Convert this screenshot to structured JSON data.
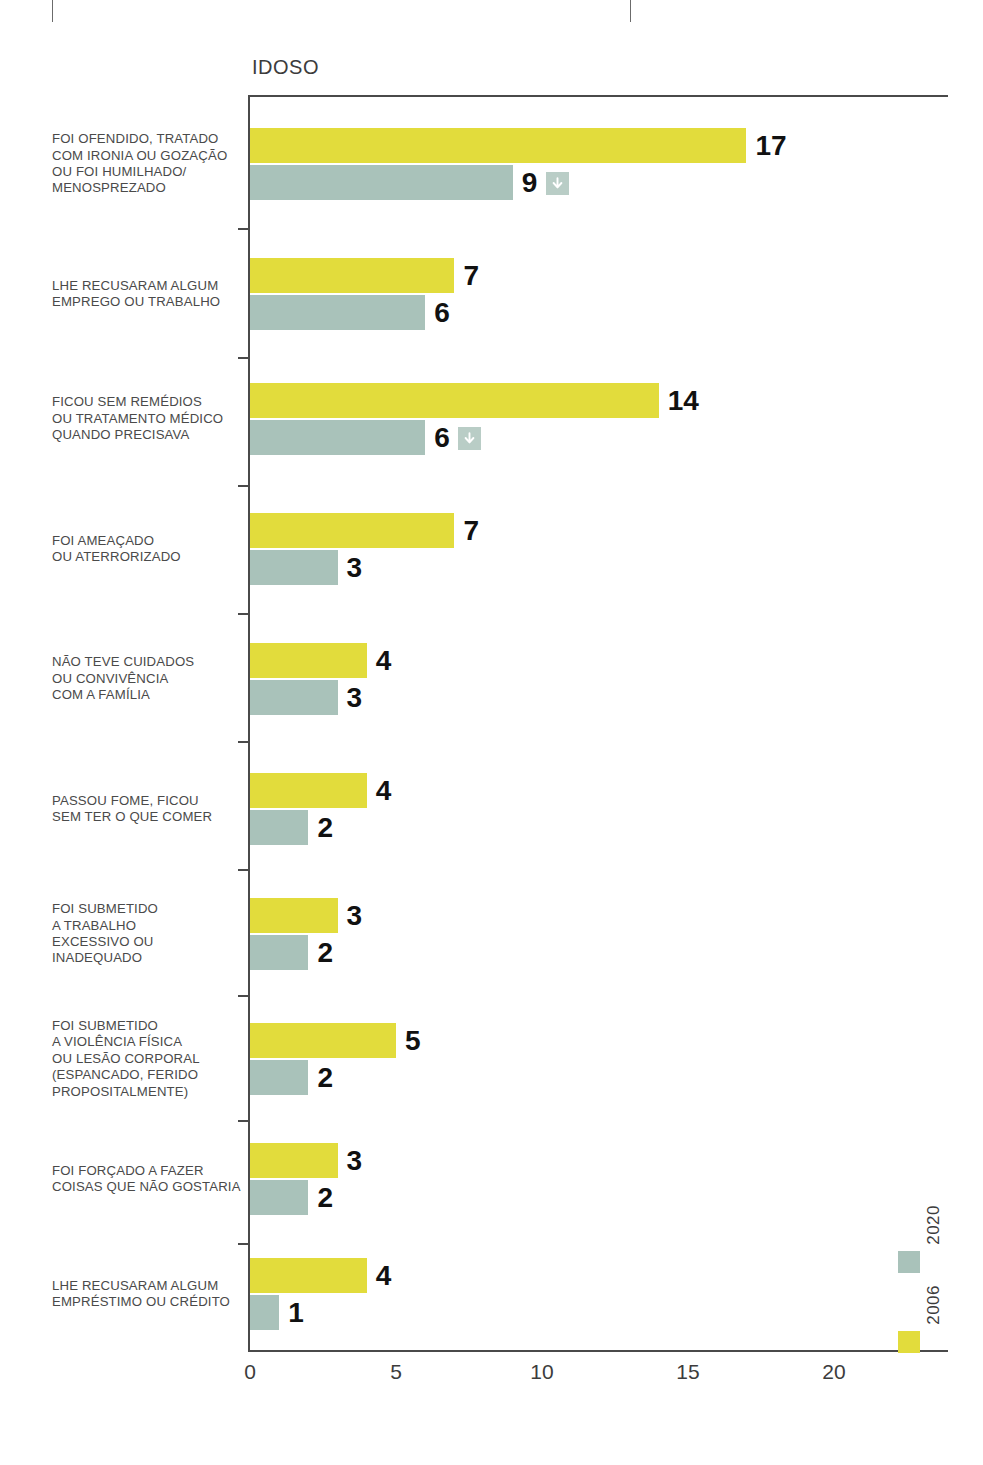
{
  "chart_data": {
    "type": "bar",
    "orientation": "horizontal",
    "title": "IDOSO",
    "xlabel": "",
    "ylabel": "",
    "xlim": [
      0,
      23.8
    ],
    "xticks": [
      0,
      5,
      10,
      15,
      20
    ],
    "xtick_labels": [
      "0",
      "5",
      "10",
      "15",
      "20"
    ],
    "grid": false,
    "legend_position": "bottom-right-vertical",
    "categories": [
      "FOI OFENDIDO, TRATADO COM IRONIA OU GOZAÇÃO OU FOI HUMILHADO/ MENOSPREZADO",
      "LHE RECUSARAM ALGUM EMPREGO OU TRABALHO",
      "FICOU SEM REMÉDIOS OU TRATAMENTO MÉDICO QUANDO PRECISAVA",
      "FOI AMEAÇADO OU ATERRORIZADO",
      "NÃO TEVE CUIDADOS OU CONVIVÊNCIA COM A FAMÍLIA",
      "PASSOU FOME, FICOU SEM TER O QUE COMER",
      "FOI SUBMETIDO A TRABALHO EXCESSIVO OU INADEQUADO",
      "FOI SUBMETIDO A VIOLÊNCIA FÍSICA OU LESÃO CORPORAL (ESPANCADO, FERIDO PROPOSITALMENTE)",
      "FOI FORÇADO A FAZER COISAS QUE NÃO GOSTARIA",
      "LHE RECUSARAM ALGUM EMPRÉSTIMO OU CRÉDITO"
    ],
    "category_lines": [
      [
        "FOI OFENDIDO, TRATADO",
        "COM IRONIA OU GOZAÇÃO",
        "OU FOI HUMILHADO/",
        "MENOSPREZADO"
      ],
      [
        "LHE RECUSARAM ALGUM",
        "EMPREGO OU TRABALHO"
      ],
      [
        "FICOU SEM REMÉDIOS",
        "OU TRATAMENTO MÉDICO",
        "QUANDO PRECISAVA"
      ],
      [
        "FOI AMEAÇADO",
        "OU ATERRORIZADO"
      ],
      [
        "NÃO TEVE CUIDADOS",
        "OU CONVIVÊNCIA",
        "COM A FAMÍLIA"
      ],
      [
        "PASSOU FOME, FICOU",
        "SEM TER O QUE COMER"
      ],
      [
        "FOI SUBMETIDO",
        "A TRABALHO",
        "EXCESSIVO OU",
        "INADEQUADO"
      ],
      [
        "FOI SUBMETIDO",
        "A VIOLÊNCIA FÍSICA",
        "OU LESÃO CORPORAL",
        "(ESPANCADO, FERIDO",
        "PROPOSITALMENTE)"
      ],
      [
        "FOI FORÇADO A FAZER",
        "COISAS QUE NÃO GOSTARIA"
      ],
      [
        "LHE RECUSARAM ALGUM",
        "EMPRÉSTIMO OU CRÉDITO"
      ]
    ],
    "series": [
      {
        "name": "2006",
        "color": "#e2dc3c",
        "values": [
          17,
          7,
          14,
          7,
          4,
          4,
          3,
          5,
          3,
          4
        ]
      },
      {
        "name": "2020",
        "color": "#a9c2ba",
        "values": [
          9,
          6,
          6,
          3,
          3,
          2,
          2,
          2,
          2,
          1
        ]
      }
    ],
    "decrease_markers": {
      "icon": "arrow-down-icon",
      "series": "2020",
      "category_indexes": [
        0,
        2
      ]
    }
  },
  "legend": {
    "entries": [
      {
        "label": "2020",
        "color": "#a9c2ba"
      },
      {
        "label": "2006",
        "color": "#e2dc3c"
      }
    ]
  }
}
